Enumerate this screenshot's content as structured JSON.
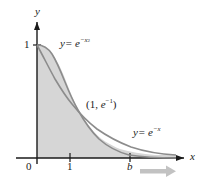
{
  "figure": {
    "type": "math-graph",
    "background": "#ffffff",
    "axes": {
      "x_axis_label": "x",
      "y_axis_label": "y",
      "origin_label": "0",
      "x_ticks": [
        {
          "label": "1",
          "value": 1
        },
        {
          "label": "b",
          "value": 3.1
        }
      ],
      "y_ticks": [
        {
          "label": "1",
          "value": 1
        }
      ],
      "x_range": [
        -0.25,
        4.0
      ],
      "y_range": [
        -0.18,
        1.22
      ],
      "has_arrowheads": true,
      "grid": false
    },
    "curves": [
      {
        "name": "gaussian",
        "label_y": "y",
        "label_eq": "= e",
        "label_exp_base": "−x",
        "label_exp_sup": "2",
        "label_plain": "y = e^{-x^2}",
        "color": "#8c8c8c",
        "label_x": 60,
        "label_y_px": 42
      },
      {
        "name": "exponential",
        "label_y": "y",
        "label_eq": "= e",
        "label_exp_base": "−x",
        "label_plain": "y = e^{-x}",
        "color": "#8c8c8c",
        "label_x": 133,
        "label_y_px": 131
      }
    ],
    "annotations": [
      {
        "name": "intersection-point",
        "text_open": "(1, ",
        "text_e": "e",
        "text_sup": "−1",
        "text_close": ")",
        "plain": "(1, e^{-1})",
        "x": 86,
        "y": 103
      }
    ],
    "shaded_region": {
      "name": "area-under-curves",
      "fill": "#d4d4d4",
      "description": "region under upper envelope of the two curves from 0 to right edge"
    },
    "direction_arrow": {
      "name": "x-direction-arrow",
      "color": "#b5b5b5",
      "description": "gray arrow below x-axis pointing right"
    },
    "colors": {
      "curve_stroke": "#8c8c8c",
      "axis_stroke": "#1a1a1a",
      "shade_fill": "#d4d4d4",
      "arrow_gray": "#bdbdbd",
      "text": "#1a1a1a"
    }
  }
}
